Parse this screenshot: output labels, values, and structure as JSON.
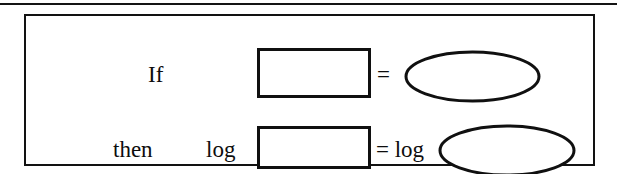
{
  "figure": {
    "kind": "math-identity-diagram",
    "ink_color": "#101010",
    "paper_color": "#ffffff",
    "rows": [
      {
        "id": "row-antecedent",
        "leading_word": "If",
        "left_operand": {
          "type": "rectangle-placeholder",
          "label": ""
        },
        "relation": "=",
        "right_operand": {
          "type": "ellipse-placeholder",
          "label": ""
        }
      },
      {
        "id": "row-consequent",
        "leading_word": "then",
        "left_function": "log",
        "left_operand": {
          "type": "rectangle-placeholder",
          "label": ""
        },
        "relation": "=",
        "right_function": "log",
        "right_operand": {
          "type": "ellipse-placeholder",
          "label": ""
        }
      }
    ],
    "relation_row2": "= log"
  }
}
